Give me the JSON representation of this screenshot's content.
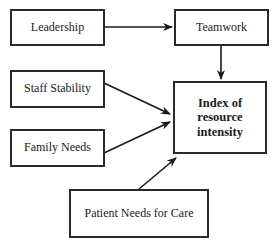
{
  "diagram": {
    "nodes": [
      {
        "id": "leadership",
        "label": "Leadership"
      },
      {
        "id": "teamwork",
        "label": "Teamwork"
      },
      {
        "id": "staff_stability",
        "label": "Staff Stability"
      },
      {
        "id": "family_needs",
        "label": "Family Needs"
      },
      {
        "id": "patient_needs",
        "label": "Patient Needs for Care"
      },
      {
        "id": "index",
        "label_line1": "Index of",
        "label_line2": "resource intensity"
      }
    ],
    "edges": [
      {
        "from": "leadership",
        "to": "teamwork"
      },
      {
        "from": "teamwork",
        "to": "index"
      },
      {
        "from": "staff_stability",
        "to": "index"
      },
      {
        "from": "family_needs",
        "to": "index"
      },
      {
        "from": "patient_needs",
        "to": "index"
      }
    ]
  }
}
